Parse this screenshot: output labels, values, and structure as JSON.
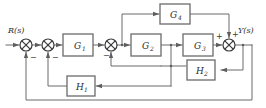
{
  "diagram": {
    "type": "block-diagram",
    "input_label": "R(s)",
    "output_label": "Y(s)",
    "colors": {
      "line": "#6b6b6b",
      "block_border": "#6b6b6b",
      "block_fill": "#ffffff",
      "text": "#2b2b2b",
      "background": "#ffffff"
    },
    "blocks": [
      {
        "id": "G1",
        "name": "G",
        "sub": "1",
        "x": 63,
        "y": 34,
        "w": 30,
        "h": 22
      },
      {
        "id": "G2",
        "name": "G",
        "sub": "2",
        "x": 131,
        "y": 34,
        "w": 30,
        "h": 22
      },
      {
        "id": "G3",
        "name": "G",
        "sub": "3",
        "x": 183,
        "y": 34,
        "w": 30,
        "h": 22
      },
      {
        "id": "G4",
        "name": "G",
        "sub": "4",
        "x": 160,
        "y": 4,
        "w": 30,
        "h": 20
      },
      {
        "id": "H1",
        "name": "H",
        "sub": "1",
        "x": 67,
        "y": 76,
        "w": 28,
        "h": 20
      },
      {
        "id": "H2",
        "name": "H",
        "sub": "2",
        "x": 187,
        "y": 60,
        "w": 28,
        "h": 20
      }
    ],
    "summing_junctions": [
      {
        "id": "S1",
        "cx": 26,
        "cy": 45,
        "r": 6,
        "signs": [
          "-"
        ]
      },
      {
        "id": "S2",
        "cx": 48,
        "cy": 45,
        "r": 6,
        "signs": [
          "-"
        ]
      },
      {
        "id": "S3",
        "cx": 111,
        "cy": 45,
        "r": 6,
        "signs": [
          "-"
        ]
      },
      {
        "id": "S4",
        "cx": 229,
        "cy": 45,
        "r": 6,
        "signs": [
          "+",
          "+"
        ]
      }
    ],
    "signs": {
      "s1_minus": "−",
      "s2_minus": "−",
      "s3_minus": "−",
      "s4_plus_left": "+",
      "s4_plus_top": "+"
    },
    "connections": [
      "R(s) -> S1",
      "S1 -> S2",
      "S2 -> G1",
      "G1 -> S3",
      "S3 -> node_a -> G2",
      "node_a -> G4 (up)",
      "G2 -> node_b -> G3",
      "G4 -> S4 (top, +)",
      "G3 -> S4 (left, +)",
      "S4 -> Y(s)",
      "Y(s) -> H2 (right input)",
      "H2 -> node_b (feedback to G3 input)",
      "node_b -> H1 (right input)",
      "H1 -> S2 (left/bottom, -)",
      "node_b_down -> S3 (-)",
      "Y(s) -> outer loop -> S1 (-)"
    ]
  }
}
